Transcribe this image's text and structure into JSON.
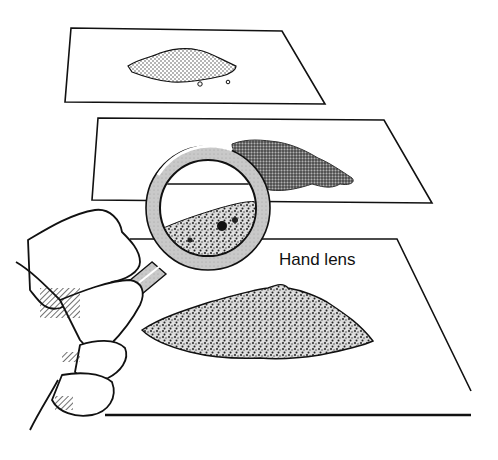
{
  "figure": {
    "label": "Hand lens",
    "colors": {
      "ink": "#111111",
      "paper": "#ffffff",
      "lens_rim": "#c8c8c8",
      "sample_light": "#bdbdbd",
      "sample_dark": "#555555"
    },
    "sheets": [
      {
        "id": "top",
        "sample": "fine dotted powder"
      },
      {
        "id": "middle",
        "sample": "dark coarse powder"
      },
      {
        "id": "bottom",
        "sample": "speckled coarse soil"
      }
    ]
  }
}
